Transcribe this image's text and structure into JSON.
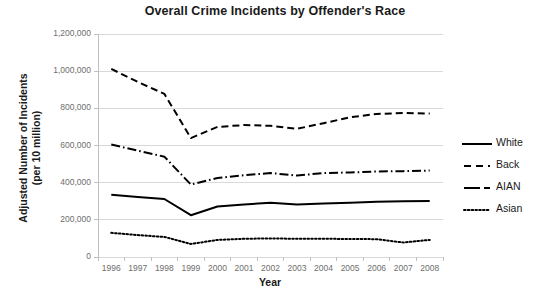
{
  "chart_data": {
    "type": "line",
    "title": "Overall Crime Incidents by Offender's Race",
    "xlabel": "Year",
    "ylabel": "Adjusted Number of Incidents (per 10 million)",
    "ylabel_line1": "Adjusted Number of Incidents",
    "ylabel_line2": "(per 10 million)",
    "x": [
      1996,
      1997,
      1998,
      1999,
      2000,
      2001,
      2002,
      2003,
      2004,
      2005,
      2006,
      2007,
      2008
    ],
    "categories": [
      "1996",
      "1997",
      "1998",
      "1999",
      "2000",
      "2001",
      "2002",
      "2003",
      "2004",
      "2005",
      "2006",
      "2007",
      "2008"
    ],
    "ylim": [
      0,
      1200000
    ],
    "yticks": [
      0,
      200000,
      400000,
      600000,
      800000,
      1000000,
      1200000
    ],
    "ytick_labels": [
      "0",
      "200,000",
      "400,000",
      "600,000",
      "800,000",
      "1,000,000",
      "1,200,000"
    ],
    "grid": true,
    "legend_position": "right",
    "series": [
      {
        "name": "White",
        "style": "solid",
        "color": "#000000",
        "values": [
          335000,
          323000,
          312000,
          225000,
          272000,
          283000,
          292000,
          283000,
          288000,
          292000,
          297000,
          300000,
          302000
        ]
      },
      {
        "name": "Back",
        "style": "dashed",
        "color": "#000000",
        "values": [
          1012000,
          942000,
          878000,
          640000,
          700000,
          710000,
          706000,
          690000,
          720000,
          752000,
          770000,
          775000,
          772000
        ]
      },
      {
        "name": "AIAN",
        "style": "dashdot",
        "color": "#000000",
        "values": [
          605000,
          572000,
          540000,
          390000,
          425000,
          440000,
          452000,
          438000,
          452000,
          455000,
          460000,
          462000,
          465000
        ]
      },
      {
        "name": "Asian",
        "style": "dotted",
        "color": "#000000",
        "values": [
          130000,
          118000,
          108000,
          70000,
          92000,
          98000,
          100000,
          98000,
          98000,
          97000,
          96000,
          78000,
          92000
        ]
      }
    ]
  },
  "legend": {
    "items": [
      {
        "label": "White",
        "style": "solid"
      },
      {
        "label": "Back",
        "style": "dashed"
      },
      {
        "label": "AIAN",
        "style": "dashdot"
      },
      {
        "label": "Asian",
        "style": "dotted"
      }
    ]
  },
  "colors": {
    "line": "#000000",
    "grid": "#d9d9d9",
    "axis": "#bfbfbf",
    "tick_text": "#6e6e6e",
    "title_text": "#1a1a1a",
    "background": "#ffffff"
  }
}
